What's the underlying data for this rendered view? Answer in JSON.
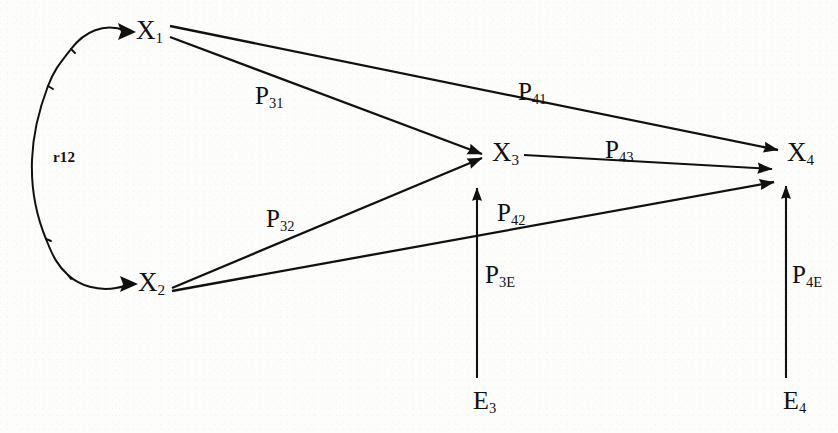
{
  "figure": {
    "type": "path-diagram",
    "background_color": "#fdfdfb",
    "ink_color": "#111111",
    "width": 838,
    "height": 433
  },
  "nodes": [
    {
      "id": "X1",
      "label": "X",
      "subscript": "1",
      "x": 136,
      "y": 31,
      "kind": "exogenous-variable"
    },
    {
      "id": "X2",
      "label": "X",
      "subscript": "2",
      "x": 138,
      "y": 283,
      "kind": "exogenous-variable"
    },
    {
      "id": "X3",
      "label": "X",
      "subscript": "3",
      "x": 492,
      "y": 153,
      "kind": "endogenous-variable"
    },
    {
      "id": "X4",
      "label": "X",
      "subscript": "4",
      "x": 787,
      "y": 153,
      "kind": "endogenous-variable"
    },
    {
      "id": "E3",
      "label": "E",
      "subscript": "3",
      "x": 473,
      "y": 404,
      "kind": "residual-term"
    },
    {
      "id": "E4",
      "label": "E",
      "subscript": "4",
      "x": 783,
      "y": 404,
      "kind": "residual-term"
    }
  ],
  "paths": [
    {
      "id": "P31",
      "label": "P",
      "subscript": "31",
      "from": "X1",
      "to": "X3",
      "label_x": 255,
      "label_y": 88,
      "kind": "directed"
    },
    {
      "id": "P41",
      "label": "P",
      "subscript": "41",
      "from": "X1",
      "to": "X4",
      "label_x": 518,
      "label_y": 84,
      "kind": "directed"
    },
    {
      "id": "P32",
      "label": "P",
      "subscript": "32",
      "from": "X2",
      "to": "X3",
      "label_x": 266,
      "label_y": 211,
      "kind": "directed"
    },
    {
      "id": "P42",
      "label": "P",
      "subscript": "42",
      "from": "X2",
      "to": "X4",
      "label_x": 497,
      "label_y": 205,
      "kind": "directed"
    },
    {
      "id": "P43",
      "label": "P",
      "subscript": "43",
      "from": "X3",
      "to": "X4",
      "label_x": 605,
      "label_y": 142,
      "kind": "directed"
    },
    {
      "id": "P3E",
      "label": "P",
      "subscript": "3E",
      "from": "E3",
      "to": "X3",
      "label_x": 485,
      "label_y": 267,
      "kind": "residual"
    },
    {
      "id": "P4E",
      "label": "P",
      "subscript": "4E",
      "from": "E4",
      "to": "X4",
      "label_x": 792,
      "label_y": 267,
      "kind": "residual"
    }
  ],
  "correlations": [
    {
      "id": "r12",
      "label": "r12",
      "between": [
        "X1",
        "X2"
      ],
      "label_x": 53,
      "label_y": 150,
      "kind": "curved-double-headed"
    }
  ]
}
